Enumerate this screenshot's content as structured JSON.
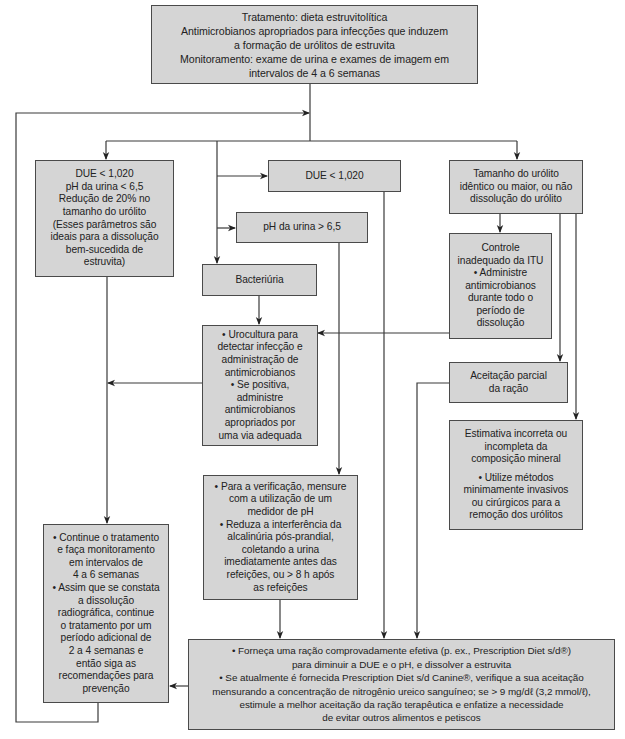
{
  "diagram": {
    "colors": {
      "box_fill": "#d5d5d5",
      "box_border": "#4a4a4a",
      "connector": "#3a3a3a",
      "text": "#222222"
    },
    "nodes": {
      "treatment": {
        "text": "Tratamento: dieta estruvitolítica\nAntimicrobianos apropriados para infecções que induzem\na formação de urólitos de estruvita\nMonitoramento: exame de urina e exames de imagem em\nintervalos de 4 a 6 semanas"
      },
      "ideal_params": {
        "text": "DUE < 1,020\npH da urina < 6,5\nRedução de 20% no\ntamanho do urólito\n(Esses parâmetros são\nideais para a dissolução\nbem-sucedida de\nestruvita)"
      },
      "due_high": {
        "text": "DUE < 1,020"
      },
      "urolith_size": {
        "text": "Tamanho do urólito\nidêntico ou maior, ou não\ndissolução do urólito"
      },
      "ph_high": {
        "text": "pH da urina > 6,5"
      },
      "bacteriuria": {
        "text": "Bacteriúria"
      },
      "uti_control": {
        "text": "Controle\ninadequado da ITU\n• Administre\nantimicrobianos\ndurante todo o\nperíodo de\ndissolução"
      },
      "urine_culture": {
        "text": "• Urocultura para\ndetectar infecção e\nadministração de\nantimicrobianos\n• Se positiva,\nadministre\nantimicrobianos\napropriados por\numa via adequada"
      },
      "partial_acceptance": {
        "text": "Aceitação parcial\nda ração"
      },
      "mineral_estimate": {
        "heading": "Estimativa incorreta ou\nincompleta da\ncomposição mineral",
        "bullet": "• Utilize métodos\nminimamente invasivos\nou cirúrgicos para a\nremoção dos urólitos"
      },
      "ph_verification": {
        "text": "• Para a verificação, mensure\ncom a utilização de um\nmedidor de pH\n• Reduza a interferência da\nalcalinúria pós-prandial,\ncoletando a urina\nimediatamente antes das\nrefeições, ou > 8 h após\nas refeições"
      },
      "continue_treatment": {
        "text": "• Continue o tratamento\ne faça monitoramento\nem intervalos de\n4 a 6 semanas\n• Assim que se constata\na dissolução\nradiográfica, continue\no tratamento por um\nperíodo adicional de\n2 a 4 semanas e\nentão siga as\nrecomendações para\nprevenção"
      },
      "effective_diet": {
        "text": "• Forneça uma ração comprovadamente efetiva (p. ex., Prescription Diet s/d®)\npara diminuir a DUE e o pH, e dissolver a estruvita\n• Se atualmente é fornecida Prescription Diet s/d Canine®, verifique a sua aceitação\nmensurando a concentração de nitrogênio ureico sanguíneo; se > 9 mg/dℓ (3,2 mmol/ℓ),\nestimule a melhor aceitação da ração terapêutica e enfatize a necessidade\nde evitar outros alimentos e petiscos"
      }
    }
  }
}
